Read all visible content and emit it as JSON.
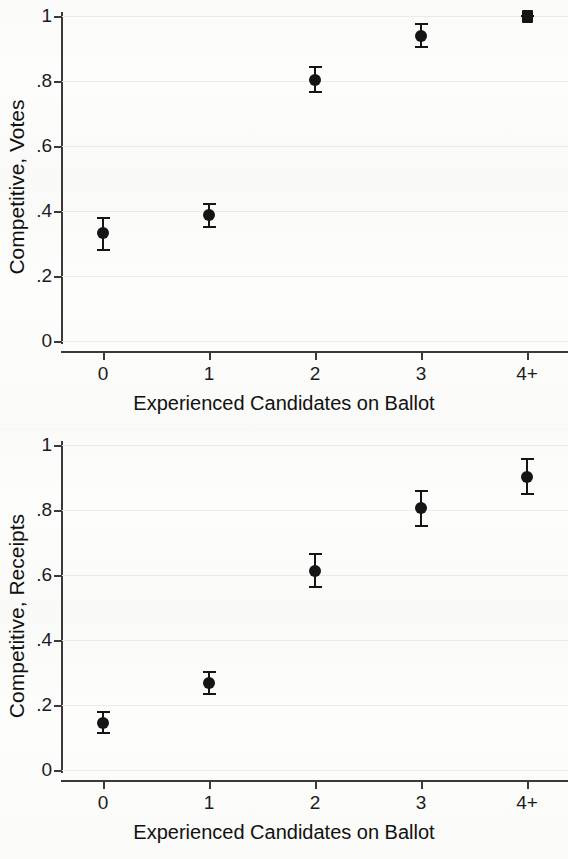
{
  "figure": {
    "background_color": "#fdfdfc",
    "marker_color": "#151515",
    "grid_color": "#ececec",
    "axis_color": "#3a3a3a"
  },
  "chart_data": [
    {
      "type": "scatter",
      "panel": "top",
      "title": "",
      "xlabel": "Experienced Candidates on Ballot",
      "ylabel": "Competitive, Votes",
      "categories": [
        "0",
        "1",
        "2",
        "3",
        "4+"
      ],
      "x": [
        0,
        1,
        2,
        3,
        4
      ],
      "values": [
        0.332,
        0.388,
        0.803,
        0.94,
        1.0
      ],
      "ci_low": [
        0.28,
        0.352,
        0.765,
        0.905,
        0.999
      ],
      "ci_high": [
        0.378,
        0.422,
        0.842,
        0.975,
        1.001
      ],
      "ytick_labels": [
        "0",
        ".2",
        ".4",
        ".6",
        ".8",
        "1"
      ],
      "ytick_values": [
        0,
        0.2,
        0.4,
        0.6,
        0.8,
        1.0
      ],
      "ylim": [
        0,
        1.04
      ],
      "xlim": [
        -0.42,
        4.42
      ],
      "grid": true,
      "legend": null,
      "marker_shape": [
        "circle",
        "circle",
        "circle",
        "circle",
        "square"
      ]
    },
    {
      "type": "scatter",
      "panel": "bottom",
      "title": "",
      "xlabel": "Experienced Candidates on Ballot",
      "ylabel": "Competitive, Receipts",
      "categories": [
        "0",
        "1",
        "2",
        "3",
        "4+"
      ],
      "x": [
        0,
        1,
        2,
        3,
        4
      ],
      "values": [
        0.145,
        0.268,
        0.612,
        0.805,
        0.903
      ],
      "ci_low": [
        0.113,
        0.235,
        0.563,
        0.752,
        0.849
      ],
      "ci_high": [
        0.178,
        0.302,
        0.665,
        0.858,
        0.958
      ],
      "ytick_labels": [
        "0",
        ".2",
        ".4",
        ".6",
        ".8",
        "1"
      ],
      "ytick_values": [
        0,
        0.2,
        0.4,
        0.6,
        0.8,
        1.0
      ],
      "ylim": [
        0,
        1.04
      ],
      "xlim": [
        -0.42,
        4.42
      ],
      "grid": true,
      "legend": null,
      "marker_shape": [
        "circle",
        "circle",
        "circle",
        "circle",
        "circle"
      ]
    }
  ]
}
